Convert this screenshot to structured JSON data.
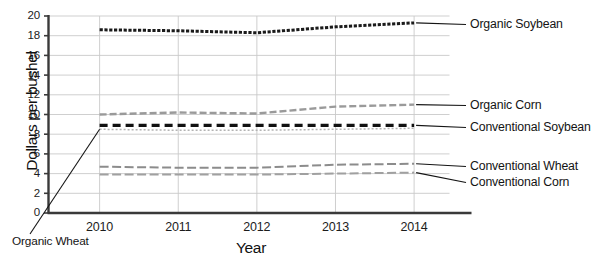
{
  "chart_data": {
    "type": "line",
    "title": "",
    "xlabel": "Year",
    "ylabel": "Dollars per bushel",
    "categories": [
      "2010",
      "2011",
      "2012",
      "2013",
      "2014"
    ],
    "x": [
      2010,
      2011,
      2012,
      2013,
      2014
    ],
    "xlim": [
      2009.35,
      2014.45
    ],
    "ylim": [
      0,
      20
    ],
    "ytick_labels": [
      "0",
      "2",
      "4",
      "6",
      "8",
      "10",
      "12",
      "14",
      "16",
      "18",
      "20"
    ],
    "yticks": [
      0,
      2,
      4,
      6,
      8,
      10,
      12,
      14,
      16,
      18,
      20
    ],
    "grid": "horizontal-and-vertical",
    "legend_position": "right-inline-callouts",
    "series": [
      {
        "name": "Organic Soybean",
        "values": [
          18.6,
          18.5,
          18.3,
          18.9,
          19.3
        ],
        "style": "dashed-heavy",
        "color": "#1a1a1a"
      },
      {
        "name": "Organic Corn",
        "values": [
          10.0,
          10.2,
          10.1,
          10.8,
          11.0
        ],
        "style": "dashed-light",
        "color": "#9a9a9a"
      },
      {
        "name": "Conventional Soybean",
        "values": [
          8.9,
          8.9,
          8.9,
          8.9,
          8.9
        ],
        "style": "dashed-bold",
        "color": "#111111"
      },
      {
        "name": "Organic Wheat",
        "values": [
          8.5,
          8.4,
          8.4,
          8.5,
          8.6
        ],
        "style": "dotted-light",
        "color": "#b4b4b4"
      },
      {
        "name": "Conventional Wheat",
        "values": [
          4.7,
          4.6,
          4.6,
          4.9,
          5.0
        ],
        "style": "dashed-medium",
        "color": "#8c8c8c"
      },
      {
        "name": "Conventional Corn",
        "values": [
          3.9,
          3.9,
          3.9,
          4.0,
          4.1
        ],
        "style": "dashed-medium",
        "color": "#a0a0a0"
      }
    ],
    "annotations": [
      {
        "text": "Organic Soybean",
        "target_series": "Organic Soybean",
        "side": "right"
      },
      {
        "text": "Organic Corn",
        "target_series": "Organic Corn",
        "side": "right"
      },
      {
        "text": "Conventional Soybean",
        "target_series": "Conventional Soybean",
        "side": "right"
      },
      {
        "text": "Conventional Wheat",
        "target_series": "Conventional Wheat",
        "side": "right"
      },
      {
        "text": "Conventional Corn",
        "target_series": "Conventional Corn",
        "side": "right"
      },
      {
        "text": "Organic Wheat",
        "target_series": "Organic Wheat",
        "side": "bottom-left"
      }
    ]
  },
  "axes": {
    "y_title": "Dollars per bushel",
    "x_title": "Year",
    "y_ticks": [
      "20",
      "18",
      "16",
      "14",
      "12",
      "10",
      "8",
      "6",
      "4",
      "2",
      "0"
    ],
    "x_ticks": [
      "2010",
      "2011",
      "2012",
      "2013",
      "2014"
    ]
  },
  "labels": {
    "organic_soybean": "Organic Soybean",
    "organic_corn": "Organic Corn",
    "conventional_soybean": "Conventional Soybean",
    "conventional_wheat": "Conventional Wheat",
    "conventional_corn": "Conventional Corn",
    "organic_wheat": "Organic Wheat"
  },
  "colors": {
    "organic_soybean": "#1a1a1a",
    "organic_corn": "#9a9a9a",
    "conventional_soybean": "#111111",
    "organic_wheat": "#b4b4b4",
    "conventional_wheat": "#8c8c8c",
    "conventional_corn": "#a0a0a0",
    "grid": "#c9c9c9",
    "axis": "#3a3a3a",
    "background": "#ffffff"
  }
}
